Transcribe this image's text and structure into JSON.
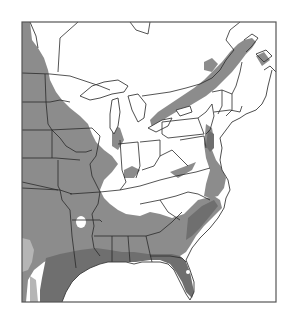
{
  "figure": {
    "type": "range map",
    "region": "Eastern United States and southeastern Canada",
    "legend": null,
    "colors": {
      "background": "#ffffff",
      "range_primary": "#8c8c8c",
      "range_dense": "#6f6f6f",
      "range_light": "#b5b5b5",
      "boundaries": "#2a2a2a",
      "frame": "#555555"
    },
    "layers": [
      {
        "name": "primary-range",
        "description": "medium gray shading: Great Plains, Mississippi valley, Ohio valley fringes, Atlantic coastal plain, St. Lawrence / Great Lakes corridor"
      },
      {
        "name": "dense-range",
        "description": "dark gray shading: Gulf coast (Texas, Louisiana, Mississippi, Alabama), Florida peninsula, Chesapeake area"
      },
      {
        "name": "light-range",
        "description": "light gray patch in south Texas"
      }
    ]
  }
}
